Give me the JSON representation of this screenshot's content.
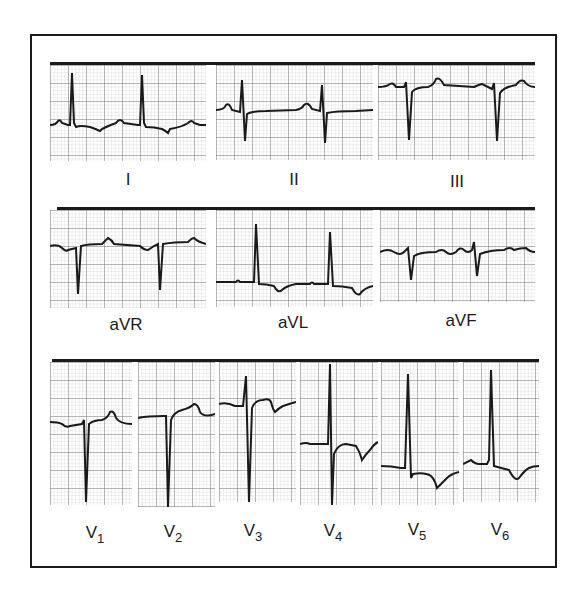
{
  "figure": {
    "trace_color": "#1a1a1a",
    "grid_minor_color": "#bdbdbd",
    "grid_major_color": "#6e6e6e",
    "rows": [
      {
        "leads": [
          {
            "id": "I",
            "label": "I"
          },
          {
            "id": "II",
            "label": "II"
          },
          {
            "id": "III",
            "label": "III"
          }
        ]
      },
      {
        "leads": [
          {
            "id": "aVR",
            "label": "aVR"
          },
          {
            "id": "aVL",
            "label": "aVL"
          },
          {
            "id": "aVF",
            "label": "aVF"
          }
        ]
      },
      {
        "leads": [
          {
            "id": "V1",
            "label": "V",
            "sub": "1"
          },
          {
            "id": "V2",
            "label": "V",
            "sub": "2"
          },
          {
            "id": "V3",
            "label": "V",
            "sub": "3"
          },
          {
            "id": "V4",
            "label": "V",
            "sub": "4"
          },
          {
            "id": "V5",
            "label": "V",
            "sub": "5"
          },
          {
            "id": "V6",
            "label": "V",
            "sub": "6"
          }
        ]
      }
    ]
  }
}
